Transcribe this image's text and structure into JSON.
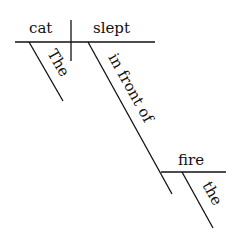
{
  "diagram": {
    "type": "Reed-Kellogg sentence diagram",
    "subject": "cat",
    "predicate": "slept",
    "subject_modifier": "The",
    "preposition": "in front of",
    "prepositional_object": "fire",
    "object_modifier": "the"
  }
}
